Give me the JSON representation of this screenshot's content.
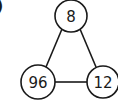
{
  "corner_mark": ")",
  "diagram": {
    "type": "triangle-number-puzzle",
    "colors": {
      "stroke": "#1a1a1a",
      "fill": "#ffffff",
      "text": "#1a1a1a"
    },
    "nodes": [
      {
        "id": "top",
        "label": "8",
        "cx": 71,
        "cy": 16,
        "r": 16
      },
      {
        "id": "bottom-left",
        "label": "96",
        "cx": 38,
        "cy": 82,
        "r": 17
      },
      {
        "id": "bottom-right",
        "label": "12",
        "cx": 103,
        "cy": 82,
        "r": 16
      }
    ],
    "edges": [
      {
        "from": "top",
        "to": "bottom-left"
      },
      {
        "from": "top",
        "to": "bottom-right"
      },
      {
        "from": "bottom-left",
        "to": "bottom-right"
      }
    ]
  }
}
